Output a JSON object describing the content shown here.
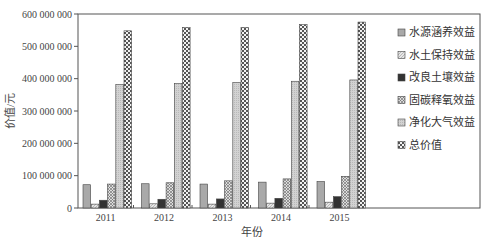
{
  "chart_data": {
    "type": "bar",
    "title": "",
    "xlabel": "年份",
    "ylabel": "价值/元",
    "categories": [
      "2011",
      "2012",
      "2013",
      "2014",
      "2015"
    ],
    "ylim": [
      0,
      600000000
    ],
    "yticks": [
      0,
      100000000,
      200000000,
      300000000,
      400000000,
      500000000,
      600000000
    ],
    "ytick_labels": [
      "0",
      "100 000 000",
      "200 000 000",
      "300 000 000",
      "400 000 000",
      "500 000 000",
      "600 000 000"
    ],
    "grid": false,
    "legend_position": "top-right",
    "series": [
      {
        "name": "水源涵养效益",
        "pattern": "gray-solid",
        "values": [
          72000000,
          75000000,
          74000000,
          80000000,
          82000000
        ]
      },
      {
        "name": "水土保持效益",
        "pattern": "light-hatch",
        "values": [
          12000000,
          13000000,
          12000000,
          15000000,
          18000000
        ]
      },
      {
        "name": "改良土壤效益",
        "pattern": "dark-solid",
        "values": [
          24000000,
          27000000,
          28000000,
          30000000,
          35000000
        ]
      },
      {
        "name": "固碳释氧效益",
        "pattern": "diagonal-hatch",
        "values": [
          74000000,
          78000000,
          84000000,
          90000000,
          98000000
        ]
      },
      {
        "name": "净化大气效益",
        "pattern": "light-dots",
        "values": [
          382000000,
          385000000,
          388000000,
          392000000,
          396000000
        ]
      },
      {
        "name": "总价值",
        "pattern": "checker",
        "values": [
          548000000,
          558000000,
          558000000,
          567000000,
          575000000
        ]
      }
    ]
  }
}
